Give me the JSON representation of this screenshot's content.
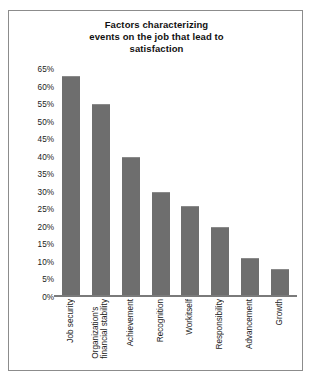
{
  "chart_data": {
    "type": "bar",
    "title": "Factors characterizing events on the job that lead to satisfaction",
    "title_lines": [
      "Factors characterizing",
      "events on the job that lead to",
      "satisfaction"
    ],
    "categories": [
      "Job security",
      "Organization's financial stability",
      "Achievement",
      "Recognition",
      "Workitself",
      "Responsibility",
      "Advancement",
      "Growth"
    ],
    "category_lines": [
      [
        "Job security"
      ],
      [
        "Organization's",
        "financial stability"
      ],
      [
        "Achievement"
      ],
      [
        "Recognition"
      ],
      [
        "Workitself"
      ],
      [
        "Responsibility"
      ],
      [
        "Advancement"
      ],
      [
        "Growth"
      ]
    ],
    "values": [
      63,
      55,
      40,
      30,
      26,
      20,
      11,
      8
    ],
    "xlabel": "",
    "ylabel": "",
    "ylim": [
      0,
      65
    ],
    "ytick_values": [
      0,
      5,
      10,
      15,
      20,
      25,
      30,
      35,
      40,
      45,
      50,
      55,
      60,
      65
    ],
    "ytick_labels": [
      "0%",
      "5%",
      "10%",
      "15%",
      "20%",
      "25%",
      "30%",
      "35%",
      "40%",
      "45%",
      "50%",
      "55%",
      "60%",
      "65%"
    ],
    "grid": false,
    "legend": false,
    "bar_color": "#6e6e6e",
    "frame_color": "#8c8c8c",
    "axis_color": "#7a7a7a",
    "text_color": "#1a1a1a"
  }
}
